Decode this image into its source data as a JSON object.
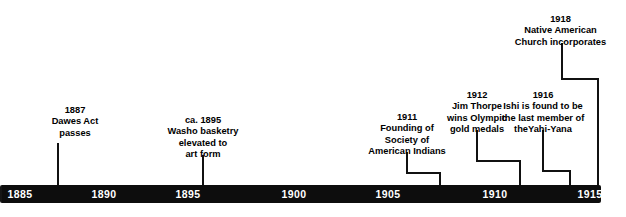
{
  "figure": {
    "type": "timeline",
    "title": "",
    "axis": {
      "name": "years-axis",
      "range_start": 1885,
      "range_end": 1918,
      "tick_labels": [
        "1885",
        "1890",
        "1895",
        "1900",
        "1905",
        "1910",
        "1915"
      ],
      "tick_positions_px": [
        20,
        104,
        188,
        294,
        388,
        495,
        590
      ],
      "bar_color": "#0d0d0d",
      "tick_text_color": "#ffffff"
    },
    "events": [
      {
        "name": "event-1887-dawes-act",
        "year": "1887",
        "lines": [
          "Dawes Act",
          "passes"
        ],
        "label_left": 20,
        "label_top": 105,
        "label_width": 110,
        "anchor_x": 58,
        "drop_from": 143,
        "elbow_x": 58
      },
      {
        "name": "event-1895-washo-basketry",
        "year": "ca. 1895",
        "lines": [
          "Washo basketry",
          "elevated to",
          "art form"
        ],
        "label_left": 143,
        "label_top": 115,
        "label_width": 124,
        "anchor_x": 203,
        "drop_from": 155,
        "elbow_x": 203
      },
      {
        "name": "event-1911-society-american-indians",
        "year": "1911",
        "lines": [
          "Founding of",
          "Society of",
          "American Indians"
        ],
        "label_left": 352,
        "label_top": 112,
        "label_width": 110,
        "anchor_x": 407,
        "drop_from": 152,
        "elbow_x": 440
      },
      {
        "name": "event-1912-jim-thorpe",
        "year": "1912",
        "lines": [
          "Jim Thorpe",
          "wins Olympic",
          "gold medals"
        ],
        "label_left": 452,
        "label_top": 90,
        "label_width": 82,
        "anchor_x": 477,
        "drop_from": 130,
        "elbow_x": 520
      },
      {
        "name": "event-1916-ishi-yahi-yana",
        "year": "1916",
        "lines": [
          "Ishi is found to be",
          "the last member of",
          "theYahi-Yana"
        ],
        "label_left": 498,
        "label_top": 90,
        "label_width": 118,
        "anchor_x": 543,
        "drop_from": 130,
        "elbow_x": 570
      },
      {
        "name": "event-1918-native-american-church",
        "year": "1918",
        "lines": [
          "Native American",
          "Church incorporates"
        ],
        "label_left": 498,
        "label_top": 14,
        "label_width": 125,
        "anchor_x": 562,
        "drop_from": 43,
        "elbow_x": 598
      }
    ]
  }
}
